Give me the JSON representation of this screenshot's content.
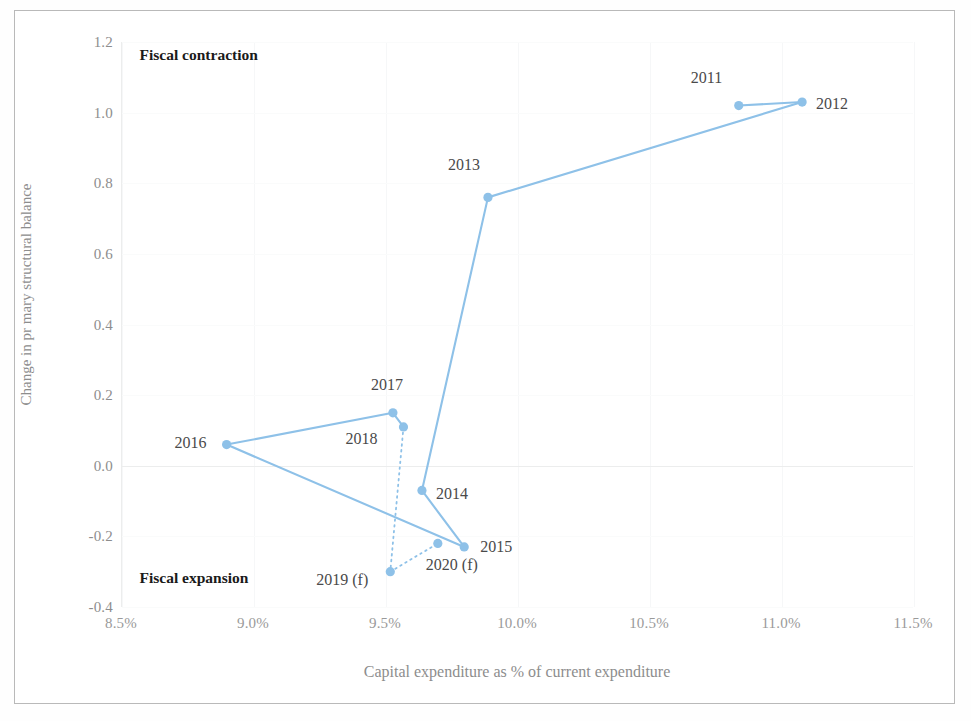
{
  "chart_data": {
    "type": "scatter",
    "title": "",
    "xlabel": "Capital expenditure as % of current expenditure",
    "ylabel": "Change in pr mary structural balance",
    "xlim": [
      8.5,
      11.5
    ],
    "ylim": [
      -0.4,
      1.2
    ],
    "xticks": [
      "8.5%",
      "9.0%",
      "9.5%",
      "10.0%",
      "10.5%",
      "11.0%",
      "11.5%"
    ],
    "xtick_values": [
      8.5,
      9.0,
      9.5,
      10.0,
      10.5,
      11.0,
      11.5
    ],
    "yticks": [
      "1.2",
      "1.0",
      "0.8",
      "0.6",
      "0.4",
      "0.2",
      "0.0",
      "-0.2",
      "-0.4"
    ],
    "ytick_values": [
      1.2,
      1.0,
      0.8,
      0.6,
      0.4,
      0.2,
      0.0,
      -0.2,
      -0.4
    ],
    "grid": true,
    "legend": "none",
    "series": [
      {
        "name": "Fiscal stance path",
        "line_style": "solid",
        "color": "#8EC1E8",
        "points": [
          {
            "label": "2011",
            "x": 10.84,
            "y": 1.02,
            "label_dx": -48,
            "label_dy": -28
          },
          {
            "label": "2012",
            "x": 11.08,
            "y": 1.03,
            "label_dx": 14,
            "label_dy": 2
          },
          {
            "label": "2013",
            "x": 9.89,
            "y": 0.76,
            "label_dx": -40,
            "label_dy": -32
          },
          {
            "label": "2014",
            "x": 9.64,
            "y": -0.07,
            "label_dx": 14,
            "label_dy": 4
          },
          {
            "label": "2015",
            "x": 9.8,
            "y": -0.23,
            "label_dx": 16,
            "label_dy": 0
          },
          {
            "label": "2016",
            "x": 8.9,
            "y": 0.06,
            "label_dx": -52,
            "label_dy": -2
          },
          {
            "label": "2017",
            "x": 9.53,
            "y": 0.15,
            "label_dx": -22,
            "label_dy": -28
          },
          {
            "label": "2018",
            "x": 9.57,
            "y": 0.11,
            "label_dx": -58,
            "label_dy": 12
          }
        ]
      },
      {
        "name": "Forecast path",
        "line_style": "dotted",
        "color": "#8EC1E8",
        "points": [
          {
            "label": "2019 (f)",
            "x": 9.52,
            "y": -0.3,
            "label_dx": -74,
            "label_dy": 8
          },
          {
            "label": "2020 (f)",
            "x": 9.7,
            "y": -0.22,
            "label_dx": -12,
            "label_dy": 22
          }
        ]
      }
    ],
    "path_order": [
      "2011",
      "2012",
      "2013",
      "2014",
      "2015",
      "2016",
      "2017",
      "2018"
    ],
    "forecast_path_order": [
      "2018",
      "2019 (f)",
      "2020 (f)",
      "2015"
    ],
    "solid_segments": [
      [
        "2011",
        "2012"
      ],
      [
        "2012",
        "2013"
      ],
      [
        "2013",
        "2014"
      ],
      [
        "2014",
        "2015"
      ],
      [
        "2015",
        "2016"
      ],
      [
        "2016",
        "2017"
      ],
      [
        "2017",
        "2018"
      ]
    ],
    "dotted_segments": [
      [
        "2018",
        "2019 (f)"
      ],
      [
        "2019 (f)",
        "2020 (f)"
      ]
    ],
    "annotations": [
      {
        "text": "Fiscal contraction",
        "x": 8.57,
        "y": 1.16,
        "name": "fiscal-contraction-note"
      },
      {
        "text": "Fiscal expansion",
        "x": 8.57,
        "y": -0.32,
        "name": "fiscal-expansion-note"
      }
    ],
    "colors": {
      "marker": "#8EC1E8",
      "line": "#8EC1E8",
      "grid": "#f3f4f5",
      "zero_line": "#e8eaec",
      "axis_text": "#8d8d8d",
      "annotation_text": "#1a1a1a",
      "point_label_text": "#4a4a4a",
      "page_border": "#b9b9b9"
    }
  }
}
